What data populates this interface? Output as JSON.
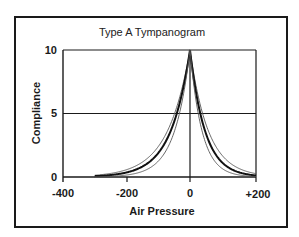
{
  "chart_data": {
    "type": "line",
    "title": "Type A Tympanogram",
    "xlabel": "Air Pressure",
    "ylabel": "Compliance",
    "xlim": [
      -400,
      200
    ],
    "ylim": [
      0,
      10
    ],
    "x_ticks": [
      -400,
      -200,
      0,
      200
    ],
    "x_tick_labels": [
      "-400",
      "-200",
      "0",
      "+200"
    ],
    "y_ticks": [
      0,
      5,
      10
    ],
    "y_tick_labels": [
      "0",
      "5",
      "10"
    ],
    "grid": {
      "horizontal_at": [
        5,
        10
      ],
      "vertical_at": [
        0,
        200
      ]
    },
    "legend": null,
    "series": [
      {
        "name": "upper-limit",
        "style": "thin",
        "peak_x": 0,
        "peak_y": 10,
        "x_start": -300,
        "x_end": 200,
        "left_decay": 70,
        "right_decay": 55
      },
      {
        "name": "typical",
        "style": "thick",
        "peak_x": 0,
        "peak_y": 10,
        "x_start": -300,
        "x_end": 200,
        "left_decay": 60,
        "right_decay": 45
      },
      {
        "name": "lower-limit",
        "style": "thin",
        "peak_x": 0,
        "peak_y": 10,
        "x_start": -300,
        "x_end": 200,
        "left_decay": 48,
        "right_decay": 36
      }
    ]
  },
  "labels": {
    "title": "Type A Tympanogram",
    "xlabel": "Air Pressure",
    "ylabel": "Compliance",
    "ytick_10": "10",
    "ytick_5": "5",
    "ytick_0": "0",
    "xtick_m400": "-400",
    "xtick_m200": "-200",
    "xtick_0": "0",
    "xtick_p200": "+200"
  },
  "colors": {
    "frame": "#1a1a1a",
    "grid": "#1a1a1a",
    "thin_curve": "#555555",
    "thick_curve": "#111111"
  }
}
